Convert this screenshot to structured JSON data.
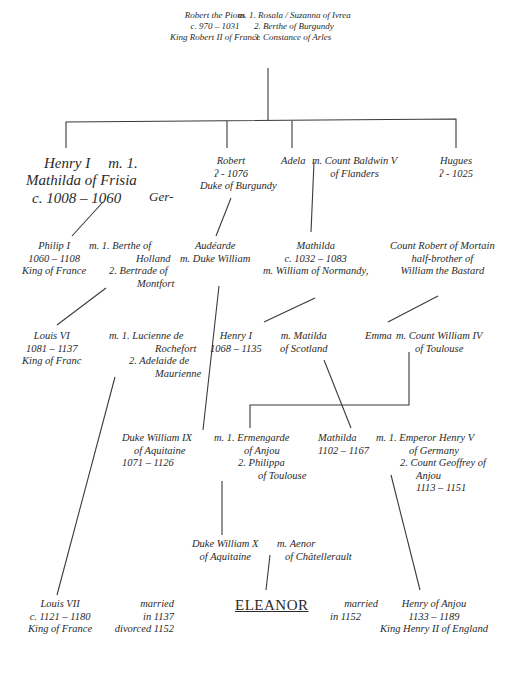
{
  "diagram": {
    "type": "family-tree",
    "root": {
      "person": [
        "Robert  the Pious",
        "c. 970 – 1031",
        "King Robert II of France"
      ],
      "spouses": [
        "m. 1. Rosala / Suzanna of Ivrea",
        "2. Berthe of Burgundy",
        "3. Constance of Arles"
      ]
    },
    "gen1": {
      "henry": [
        "Henry I",
        "Mathilda of Frisia",
        "c. 1008 – 1060"
      ],
      "henry_marriage": "m. 1.",
      "henry_extra": "Ger-",
      "robert": [
        "Robert",
        "ʔ - 1076",
        "Duke of Burgundy"
      ],
      "adela": "Adela",
      "adela_marriage": [
        "m. Count Baldwin V",
        "of Flanders"
      ],
      "hugues": [
        "Hugues",
        "ʔ - 1025"
      ]
    },
    "gen2": {
      "philip": [
        "Philip I",
        "1060 – 1108",
        "King of France"
      ],
      "philip_marriage": [
        "m. 1. Berthe of",
        "Holland",
        "2. Bertrade of",
        "Montfort"
      ],
      "audearde": [
        "Audéarde",
        "m. Duke William"
      ],
      "mathilda": [
        "Mathilda",
        "c. 1032 – 1083",
        "m. William of Normandy,"
      ],
      "count_robert": [
        "Count Robert of Mortain",
        "half-brother of",
        "William the Bastard"
      ]
    },
    "gen3": {
      "louis6": [
        "Louis VI",
        "1081 – 1137",
        "King of Franc"
      ],
      "louis6_marriage": [
        "m. 1. Lucienne de",
        "Rochefort",
        "2. Adelaide de",
        "Maurienne"
      ],
      "henry1": [
        "Henry I",
        "1068 – 1135"
      ],
      "henry1_marriage": [
        "m. Matilda",
        "of Scotland"
      ],
      "emma": "Emma",
      "emma_marriage": [
        "m. Count William IV",
        "of Toulouse"
      ]
    },
    "gen4": {
      "william9": [
        "Duke William IX",
        "of Aquitaine",
        "1071 – 1126"
      ],
      "william9_marriage": [
        "m. 1. Ermengarde",
        "of Anjou",
        "2. Philippa",
        "of Toulouse"
      ],
      "mathilda2": [
        "Mathilda",
        "1102 – 1167"
      ],
      "mathilda2_marriage": [
        "m. 1. Emperor Henry V",
        "of Germany",
        "2. Count Geoffrey of",
        "Anjou",
        "1113 – 1151"
      ]
    },
    "gen5": {
      "william10": [
        "Duke William X",
        "of Aquitaine"
      ],
      "william10_marriage": [
        "m. Aenor",
        "of Châtellerault"
      ]
    },
    "gen6": {
      "louis7": [
        "Louis VII",
        "c. 1121 – 1180",
        "King of France"
      ],
      "married1": [
        "married",
        "in 1137",
        "divorced 1152"
      ],
      "eleanor": "ELEANOR",
      "married2": [
        "married",
        "in 1152"
      ],
      "henry_anjou": [
        "Henry of Anjou",
        "1133 – 1189",
        "King Henry II of England"
      ]
    },
    "line_color": "#3a3a3a",
    "text_color": "#2a2a2a"
  }
}
